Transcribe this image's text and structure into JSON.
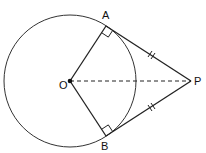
{
  "diagram": {
    "labels": {
      "A": "A",
      "B": "B",
      "O": "O",
      "P": "P"
    },
    "points": {
      "O": [
        70,
        81
      ],
      "A": [
        106,
        26
      ],
      "B": [
        106,
        136
      ],
      "P": [
        191,
        81
      ]
    },
    "circle": {
      "cx": 70,
      "cy": 81,
      "r": 66
    },
    "segments": [
      {
        "from": "O",
        "to": "A",
        "style": "solid"
      },
      {
        "from": "O",
        "to": "B",
        "style": "solid"
      },
      {
        "from": "A",
        "to": "P",
        "style": "solid",
        "tick": "double"
      },
      {
        "from": "B",
        "to": "P",
        "style": "solid",
        "tick": "double"
      },
      {
        "from": "O",
        "to": "P",
        "style": "dashed"
      }
    ],
    "right_angles": [
      "A",
      "B"
    ],
    "stroke_color": "#222222"
  }
}
